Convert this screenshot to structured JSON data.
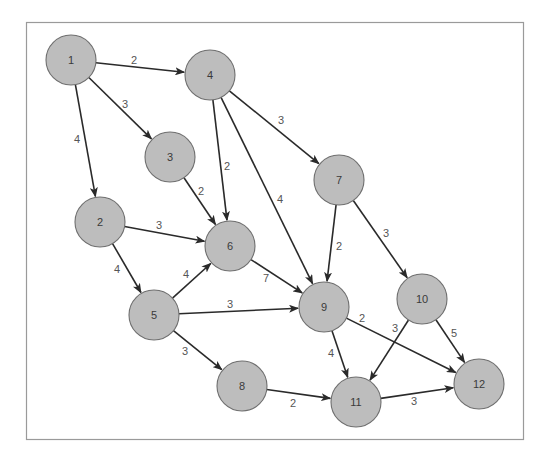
{
  "diagram": {
    "type": "directed-weighted-graph",
    "node_radius": 25,
    "colors": {
      "node_fill": "#bdbdbd",
      "node_stroke": "#6e6e6e",
      "edge": "#2a2a2a",
      "frame": "#9a9a9a"
    },
    "nodes": [
      {
        "id": "1",
        "label": "1",
        "x": 71,
        "y": 60
      },
      {
        "id": "2",
        "label": "2",
        "x": 100,
        "y": 222
      },
      {
        "id": "3",
        "label": "3",
        "x": 170,
        "y": 157
      },
      {
        "id": "4",
        "label": "4",
        "x": 210,
        "y": 75
      },
      {
        "id": "5",
        "label": "5",
        "x": 154,
        "y": 315
      },
      {
        "id": "6",
        "label": "6",
        "x": 230,
        "y": 246
      },
      {
        "id": "7",
        "label": "7",
        "x": 339,
        "y": 180
      },
      {
        "id": "8",
        "label": "8",
        "x": 242,
        "y": 386
      },
      {
        "id": "9",
        "label": "9",
        "x": 324,
        "y": 307
      },
      {
        "id": "10",
        "label": "10",
        "x": 422,
        "y": 299
      },
      {
        "id": "11",
        "label": "11",
        "x": 356,
        "y": 402
      },
      {
        "id": "12",
        "label": "12",
        "x": 479,
        "y": 384
      }
    ],
    "edges": [
      {
        "from": "1",
        "to": "4",
        "weight": "2",
        "lx": 134,
        "ly": 60
      },
      {
        "from": "1",
        "to": "3",
        "weight": "3",
        "lx": 125,
        "ly": 104
      },
      {
        "from": "1",
        "to": "2",
        "weight": "4",
        "lx": 77,
        "ly": 139
      },
      {
        "from": "4",
        "to": "6",
        "weight": "2",
        "lx": 227,
        "ly": 166
      },
      {
        "from": "4",
        "to": "9",
        "weight": "4",
        "lx": 280,
        "ly": 199
      },
      {
        "from": "4",
        "to": "7",
        "weight": "3",
        "lx": 281,
        "ly": 120
      },
      {
        "from": "3",
        "to": "6",
        "weight": "2",
        "lx": 201,
        "ly": 191
      },
      {
        "from": "2",
        "to": "6",
        "weight": "3",
        "lx": 159,
        "ly": 225
      },
      {
        "from": "2",
        "to": "5",
        "weight": "4",
        "lx": 117,
        "ly": 269
      },
      {
        "from": "5",
        "to": "6",
        "weight": "4",
        "lx": 186,
        "ly": 274
      },
      {
        "from": "5",
        "to": "9",
        "weight": "3",
        "lx": 230,
        "ly": 304
      },
      {
        "from": "5",
        "to": "8",
        "weight": "3",
        "lx": 185,
        "ly": 351
      },
      {
        "from": "6",
        "to": "9",
        "weight": "7",
        "lx": 266,
        "ly": 278
      },
      {
        "from": "7",
        "to": "9",
        "weight": "2",
        "lx": 339,
        "ly": 246
      },
      {
        "from": "7",
        "to": "10",
        "weight": "3",
        "lx": 386,
        "ly": 233
      },
      {
        "from": "9",
        "to": "11",
        "weight": "4",
        "lx": 331,
        "ly": 353
      },
      {
        "from": "9",
        "to": "12",
        "weight": "2",
        "lx": 362,
        "ly": 318
      },
      {
        "from": "10",
        "to": "11",
        "weight": "3",
        "lx": 395,
        "ly": 328
      },
      {
        "from": "10",
        "to": "12",
        "weight": "5",
        "lx": 454,
        "ly": 333
      },
      {
        "from": "8",
        "to": "11",
        "weight": "2",
        "lx": 293,
        "ly": 403
      },
      {
        "from": "11",
        "to": "12",
        "weight": "3",
        "lx": 414,
        "ly": 401
      }
    ]
  }
}
